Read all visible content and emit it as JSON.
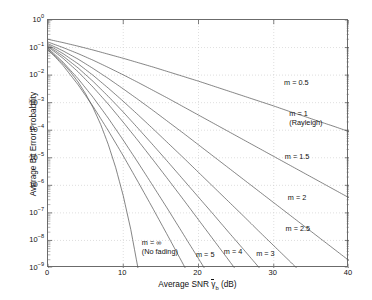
{
  "chart_data": {
    "type": "line",
    "title": "",
    "xlabel": "Average SNR γ̄_b (dB)",
    "ylabel": "Average Bit Error Probability",
    "xlabel_parts": {
      "prefix": "Average SNR ",
      "symbol": "γ",
      "subscript": "b",
      "suffix": " (dB)"
    },
    "xlim": [
      0,
      40
    ],
    "ylim": [
      1e-09,
      1
    ],
    "yscale": "log",
    "xscale": "linear",
    "grid": true,
    "legend": "none (inline curve annotations)",
    "xticks": [
      "0",
      "10",
      "20",
      "30",
      "40"
    ],
    "xtick_values": [
      0,
      10,
      20,
      30,
      40
    ],
    "yticks": [
      "10^0",
      "10^-1",
      "10^-2",
      "10^-3",
      "10^-4",
      "10^-5",
      "10^-6",
      "10^-7",
      "10^-8",
      "10^-9"
    ],
    "ytick_exponents": [
      0,
      -1,
      -2,
      -3,
      -4,
      -5,
      -6,
      -7,
      -8,
      -9
    ],
    "annotations": [
      {
        "label": "m = 0.5",
        "x": 31.5,
        "y_exp": -2.33
      },
      {
        "label": "m = 1",
        "x": 32.2,
        "y_exp": -3.45
      },
      {
        "label": "(Rayleigh)",
        "x": 32.2,
        "y_exp": -3.78
      },
      {
        "label": "m = 1.5",
        "x": 31.6,
        "y_exp": -5.02
      },
      {
        "label": "m = 2",
        "x": 32.0,
        "y_exp": -6.48
      },
      {
        "label": "m = 2.5",
        "x": 31.7,
        "y_exp": -7.63
      },
      {
        "label": "m = 3",
        "x": 27.8,
        "y_exp": -8.52
      },
      {
        "label": "m = 4",
        "x": 23.5,
        "y_exp": -8.46
      },
      {
        "label": "m = 5",
        "x": 19.8,
        "y_exp": -8.55
      },
      {
        "label": "m = ∞",
        "x": 12.6,
        "y_exp": -8.12
      },
      {
        "label": "(No fading)",
        "x": 12.6,
        "y_exp": -8.45
      }
    ],
    "series": [
      {
        "name": "m = 0.5",
        "m": 0.5,
        "x": [
          0,
          2,
          4,
          6,
          8,
          10,
          12,
          14,
          16,
          18,
          20,
          22,
          24,
          26,
          28,
          30,
          32,
          34,
          36,
          38,
          40
        ],
        "y_exp": [
          -0.7,
          -0.82,
          -0.95,
          -1.09,
          -1.24,
          -1.39,
          -1.55,
          -1.71,
          -1.88,
          -2.05,
          -2.22,
          -2.4,
          -2.58,
          -2.76,
          -2.94,
          -3.12,
          -3.31,
          -3.49,
          -3.68,
          -3.86,
          -4.05
        ]
      },
      {
        "name": "m = 1",
        "m": 1,
        "x": [
          0,
          2,
          4,
          6,
          8,
          10,
          12,
          14,
          16,
          18,
          20,
          22,
          24,
          26,
          28,
          30,
          32,
          34,
          36,
          38,
          40
        ],
        "y_exp": [
          -0.8,
          -1.0,
          -1.22,
          -1.46,
          -1.72,
          -1.99,
          -2.27,
          -2.56,
          -2.85,
          -3.15,
          -3.45,
          -3.75,
          -4.05,
          -4.35,
          -4.65,
          -4.95,
          -5.25,
          -5.55,
          -5.85,
          -6.15,
          -6.45
        ]
      },
      {
        "name": "m = 1.5",
        "m": 1.5,
        "x": [
          0,
          2,
          4,
          6,
          8,
          10,
          12,
          14,
          16,
          18,
          20,
          22,
          24,
          26,
          28,
          30,
          32,
          34,
          36,
          38,
          40
        ],
        "y_exp": [
          -0.86,
          -1.12,
          -1.42,
          -1.76,
          -2.12,
          -2.5,
          -2.89,
          -3.29,
          -3.7,
          -4.11,
          -4.53,
          -4.95,
          -5.37,
          -5.79,
          -6.21,
          -6.63,
          -7.05,
          -7.47,
          -7.89,
          -8.31,
          -8.73
        ]
      },
      {
        "name": "m = 2",
        "m": 2,
        "x": [
          0,
          2,
          4,
          6,
          8,
          10,
          12,
          14,
          16,
          18,
          20,
          22,
          24,
          26,
          28,
          30,
          32,
          34,
          36,
          38,
          40
        ],
        "y_exp": [
          -0.9,
          -1.22,
          -1.59,
          -2.01,
          -2.47,
          -2.95,
          -3.45,
          -3.96,
          -4.48,
          -5.0,
          -5.53,
          -6.06,
          -6.59,
          -7.12,
          -7.66,
          -8.19,
          -8.72,
          -9.26,
          -9.79,
          -10.3,
          -10.9
        ]
      },
      {
        "name": "m = 2.5",
        "m": 2.5,
        "x": [
          0,
          2,
          4,
          6,
          8,
          10,
          12,
          14,
          16,
          18,
          20,
          22,
          24,
          26,
          28,
          30,
          32,
          34,
          36,
          38,
          40
        ],
        "y_exp": [
          -0.94,
          -1.31,
          -1.74,
          -2.23,
          -2.77,
          -3.34,
          -3.94,
          -4.55,
          -5.17,
          -5.8,
          -6.43,
          -7.06,
          -7.7,
          -8.33,
          -8.97,
          -9.61,
          -10.2,
          -10.9,
          -11.5,
          -12.2,
          -12.8
        ]
      },
      {
        "name": "m = 3",
        "m": 3,
        "x": [
          0,
          2,
          4,
          6,
          8,
          10,
          12,
          14,
          16,
          18,
          20,
          22,
          24,
          26,
          28,
          30,
          32,
          34,
          36,
          38,
          40
        ],
        "y_exp": [
          -0.97,
          -1.39,
          -1.88,
          -2.44,
          -3.05,
          -3.71,
          -4.39,
          -5.09,
          -5.8,
          -6.52,
          -7.25,
          -7.98,
          -8.71,
          -9.44,
          -10.2,
          -10.9,
          -11.6,
          -12.4,
          -13.1,
          -13.8,
          -14.6
        ]
      },
      {
        "name": "m = 4",
        "m": 4,
        "x": [
          0,
          2,
          4,
          6,
          8,
          10,
          12,
          14,
          16,
          18,
          20,
          22,
          24,
          26,
          28,
          30,
          32,
          34,
          36,
          38,
          40
        ],
        "y_exp": [
          -1.02,
          -1.53,
          -2.13,
          -2.81,
          -3.56,
          -4.36,
          -5.19,
          -6.04,
          -6.9,
          -7.78,
          -8.66,
          -9.54,
          -10.4,
          -11.3,
          -12.2,
          -13.1,
          -14.0,
          -14.9,
          -15.8,
          -16.7,
          -17.6
        ]
      },
      {
        "name": "m = 5",
        "m": 5,
        "x": [
          0,
          2,
          4,
          6,
          8,
          10,
          12,
          14,
          16,
          18,
          20,
          22,
          24,
          26,
          28,
          30,
          32,
          34,
          36,
          38,
          40
        ],
        "y_exp": [
          -1.06,
          -1.65,
          -2.35,
          -3.14,
          -4.01,
          -4.93,
          -5.89,
          -6.87,
          -7.87,
          -8.88,
          -9.9,
          -10.9,
          -11.9,
          -13.0,
          -14.0,
          -15.0,
          -16.1,
          -17.1,
          -18.1,
          -19.2,
          -20.2
        ]
      },
      {
        "name": "m = ∞ (No fading)",
        "m": "inf",
        "x": [
          0,
          1,
          2,
          3,
          4,
          5,
          6,
          7,
          8,
          9,
          10,
          11,
          12,
          13,
          14
        ],
        "y_exp": [
          -1.1,
          -1.32,
          -1.58,
          -1.89,
          -2.25,
          -2.68,
          -3.19,
          -3.79,
          -4.51,
          -5.36,
          -6.38,
          -7.6,
          -9.07,
          -10.8,
          -12.9
        ]
      }
    ]
  }
}
